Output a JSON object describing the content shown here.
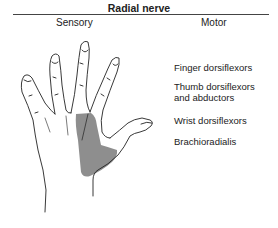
{
  "title": "Radial nerve",
  "columns": {
    "sensory": "Sensory",
    "motor": "Motor"
  },
  "motor_items": [
    {
      "line1": "Finger dorsiflexors",
      "line2": ""
    },
    {
      "line1": "Thumb dorsiflexors",
      "line2": "and abductors"
    },
    {
      "line1": "Wrist dorsiflexors",
      "line2": ""
    },
    {
      "line1": "Brachioradialis",
      "line2": ""
    }
  ],
  "figure": {
    "shaded_region": "radial nerve sensory distribution (dorsum of thumb-side hand)",
    "shade_color": "#8e8e8e",
    "line_color": "#222222"
  }
}
